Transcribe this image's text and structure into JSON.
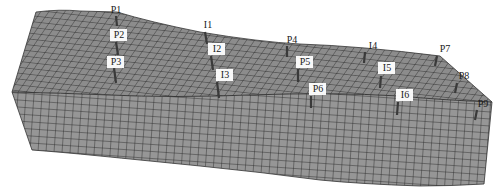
{
  "figure": {
    "type": "3D reservoir grid mesh with well locations",
    "colors": {
      "mesh_fill_top": "#8c8c8c",
      "mesh_fill_side": "#959595",
      "grid_line": "#2a2a2a",
      "well": "#3a3a3a",
      "background": "#ffffff"
    },
    "wells": [
      {
        "id": "P1",
        "label": "P1",
        "type": "producer",
        "boxed": false,
        "label_x": 116,
        "label_y": 13,
        "well_x1": 116,
        "well_y1": 16,
        "well_x2": 117,
        "well_y2": 26
      },
      {
        "id": "P2",
        "label": "P2",
        "type": "producer",
        "boxed": true,
        "label_x": 119,
        "label_y": 38,
        "well_x1": 116,
        "well_y1": 42,
        "well_x2": 118,
        "well_y2": 55
      },
      {
        "id": "P3",
        "label": "P3",
        "type": "producer",
        "boxed": true,
        "label_x": 116,
        "label_y": 65,
        "well_x1": 114,
        "well_y1": 68,
        "well_x2": 116,
        "well_y2": 83
      },
      {
        "id": "I1",
        "label": "I1",
        "type": "injector",
        "boxed": false,
        "label_x": 208,
        "label_y": 28,
        "well_x1": 205,
        "well_y1": 32,
        "well_x2": 207,
        "well_y2": 44
      },
      {
        "id": "I2",
        "label": "I2",
        "type": "injector",
        "boxed": true,
        "label_x": 217,
        "label_y": 52,
        "well_x1": 211,
        "well_y1": 56,
        "well_x2": 213,
        "well_y2": 70
      },
      {
        "id": "I3",
        "label": "I3",
        "type": "injector",
        "boxed": true,
        "label_x": 225,
        "label_y": 78,
        "well_x1": 217,
        "well_y1": 82,
        "well_x2": 219,
        "well_y2": 98
      },
      {
        "id": "P4",
        "label": "P4",
        "type": "producer",
        "boxed": false,
        "label_x": 292,
        "label_y": 43,
        "well_x1": 287,
        "well_y1": 46,
        "well_x2": 287,
        "well_y2": 57
      },
      {
        "id": "P5",
        "label": "P5",
        "type": "producer",
        "boxed": true,
        "label_x": 305,
        "label_y": 65,
        "well_x1": 298,
        "well_y1": 69,
        "well_x2": 298,
        "well_y2": 82
      },
      {
        "id": "P6",
        "label": "P6",
        "type": "producer",
        "boxed": true,
        "label_x": 318,
        "label_y": 92,
        "well_x1": 311,
        "well_y1": 96,
        "well_x2": 311,
        "well_y2": 108
      },
      {
        "id": "I4",
        "label": "I4",
        "type": "injector",
        "boxed": false,
        "label_x": 373,
        "label_y": 49,
        "well_x1": 365,
        "well_y1": 52,
        "well_x2": 364,
        "well_y2": 63
      },
      {
        "id": "I5",
        "label": "I5",
        "type": "injector",
        "boxed": true,
        "label_x": 387,
        "label_y": 71,
        "well_x1": 381,
        "well_y1": 76,
        "well_x2": 380,
        "well_y2": 88
      },
      {
        "id": "I6",
        "label": "I6",
        "type": "injector",
        "boxed": true,
        "label_x": 405,
        "label_y": 98,
        "well_x1": 398,
        "well_y1": 102,
        "well_x2": 397,
        "well_y2": 115
      },
      {
        "id": "P7",
        "label": "P7",
        "type": "producer",
        "boxed": false,
        "label_x": 445,
        "label_y": 52,
        "well_x1": 437,
        "well_y1": 56,
        "well_x2": 435,
        "well_y2": 66
      },
      {
        "id": "P8",
        "label": "P8",
        "type": "producer",
        "boxed": false,
        "label_x": 464,
        "label_y": 79,
        "well_x1": 457,
        "well_y1": 83,
        "well_x2": 455,
        "well_y2": 93
      },
      {
        "id": "P9",
        "label": "P9",
        "type": "producer",
        "boxed": false,
        "label_x": 483,
        "label_y": 107,
        "well_x1": 477,
        "well_y1": 110,
        "well_x2": 475,
        "well_y2": 120
      }
    ]
  }
}
